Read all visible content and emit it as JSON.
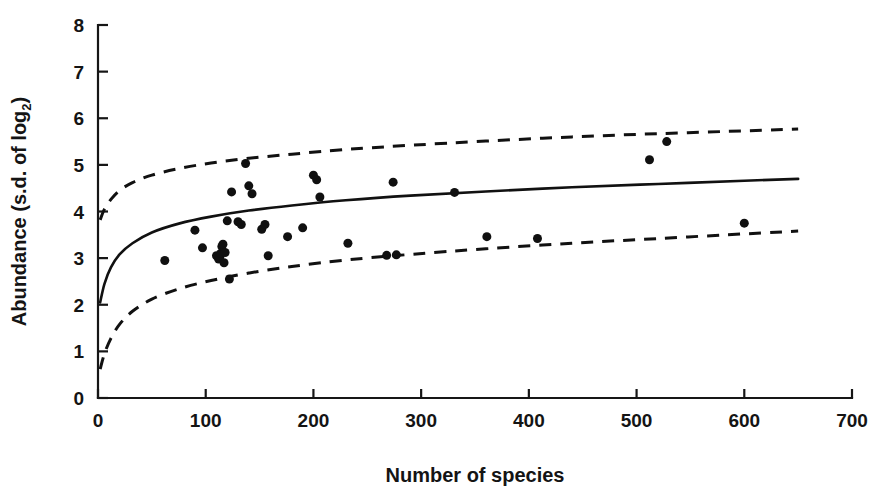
{
  "figure": {
    "background": "#ffffff",
    "ink_color": "#111111"
  },
  "axes": {
    "x": {
      "title": "Number of species",
      "ticks": [
        0,
        100,
        200,
        300,
        400,
        500,
        600,
        700
      ],
      "tick_labels": [
        "0",
        "100",
        "200",
        "300",
        "400",
        "500",
        "600",
        "700"
      ],
      "min": 0,
      "max": 700
    },
    "y": {
      "title_main": "Abundance (s.d. of log",
      "title_sub": "2",
      "title_tail": ")",
      "title_full": "Abundance (s.d. of log2)",
      "ticks": [
        0,
        1,
        2,
        3,
        4,
        5,
        6,
        7,
        8
      ],
      "tick_labels": [
        "0",
        "1",
        "2",
        "3",
        "4",
        "5",
        "6",
        "7",
        "8"
      ],
      "min": 0,
      "max": 8
    }
  },
  "chart_data": {
    "type": "scatter",
    "title": "",
    "xlabel": "Number of species",
    "ylabel": "Abundance (s.d. of log2)",
    "xlim": [
      0,
      700
    ],
    "ylim": [
      0,
      8
    ],
    "grid": false,
    "legend": "none",
    "x": [
      62,
      90,
      97,
      110,
      112,
      113,
      114,
      115,
      116,
      117,
      118,
      120,
      122,
      124,
      130,
      133,
      137,
      140,
      143,
      152,
      155,
      158,
      176,
      190,
      200,
      203,
      206,
      232,
      268,
      274,
      277,
      331,
      361,
      408,
      512,
      528,
      600
    ],
    "y": [
      2.95,
      3.6,
      3.22,
      3.05,
      2.98,
      3.02,
      3.1,
      3.25,
      3.3,
      2.9,
      3.12,
      3.8,
      2.55,
      4.42,
      3.78,
      3.72,
      5.03,
      4.55,
      4.38,
      3.62,
      3.72,
      3.05,
      3.46,
      3.65,
      4.78,
      4.68,
      4.31,
      3.32,
      3.06,
      4.63,
      3.07,
      4.41,
      3.46,
      3.42,
      5.11,
      5.5,
      3.75
    ],
    "points": [
      {
        "x": 62,
        "y": 2.95
      },
      {
        "x": 90,
        "y": 3.6
      },
      {
        "x": 97,
        "y": 3.22
      },
      {
        "x": 110,
        "y": 3.05
      },
      {
        "x": 112,
        "y": 2.98
      },
      {
        "x": 113,
        "y": 3.02
      },
      {
        "x": 114,
        "y": 3.1
      },
      {
        "x": 115,
        "y": 3.25
      },
      {
        "x": 116,
        "y": 3.3
      },
      {
        "x": 117,
        "y": 2.9
      },
      {
        "x": 118,
        "y": 3.12
      },
      {
        "x": 120,
        "y": 3.8
      },
      {
        "x": 122,
        "y": 2.55
      },
      {
        "x": 124,
        "y": 4.42
      },
      {
        "x": 130,
        "y": 3.78
      },
      {
        "x": 133,
        "y": 3.72
      },
      {
        "x": 137,
        "y": 5.03
      },
      {
        "x": 140,
        "y": 4.55
      },
      {
        "x": 143,
        "y": 4.38
      },
      {
        "x": 152,
        "y": 3.62
      },
      {
        "x": 155,
        "y": 3.72
      },
      {
        "x": 158,
        "y": 3.05
      },
      {
        "x": 176,
        "y": 3.46
      },
      {
        "x": 190,
        "y": 3.65
      },
      {
        "x": 200,
        "y": 4.78
      },
      {
        "x": 203,
        "y": 4.68
      },
      {
        "x": 206,
        "y": 4.31
      },
      {
        "x": 232,
        "y": 3.32
      },
      {
        "x": 268,
        "y": 3.06
      },
      {
        "x": 274,
        "y": 4.63
      },
      {
        "x": 277,
        "y": 3.07
      },
      {
        "x": 331,
        "y": 4.41
      },
      {
        "x": 361,
        "y": 3.46
      },
      {
        "x": 408,
        "y": 3.42
      },
      {
        "x": 512,
        "y": 5.11
      },
      {
        "x": 528,
        "y": 5.5
      },
      {
        "x": 600,
        "y": 3.75
      }
    ],
    "marker": {
      "shape": "circle",
      "size_px": 9,
      "color": "#101010"
    },
    "series": [
      {
        "name": "fitted curve",
        "style": "solid",
        "x": [
          2,
          6,
          12,
          20,
          32,
          50,
          75,
          105,
          140,
          180,
          230,
          290,
          360,
          440,
          520,
          600,
          650
        ],
        "y": [
          2.05,
          2.45,
          2.8,
          3.08,
          3.32,
          3.55,
          3.74,
          3.89,
          4.02,
          4.13,
          4.24,
          4.34,
          4.43,
          4.52,
          4.59,
          4.66,
          4.7
        ]
      },
      {
        "name": "upper confidence limit",
        "style": "dashed",
        "x": [
          2,
          6,
          12,
          20,
          32,
          50,
          75,
          105,
          140,
          180,
          230,
          290,
          360,
          440,
          520,
          600,
          650
        ],
        "y": [
          3.82,
          4.05,
          4.26,
          4.45,
          4.62,
          4.78,
          4.92,
          5.04,
          5.14,
          5.23,
          5.33,
          5.42,
          5.51,
          5.6,
          5.67,
          5.73,
          5.77
        ]
      },
      {
        "name": "lower confidence limit",
        "style": "dashed",
        "x": [
          2,
          6,
          12,
          20,
          32,
          50,
          75,
          105,
          140,
          180,
          230,
          290,
          360,
          440,
          520,
          600,
          650
        ],
        "y": [
          0.62,
          0.95,
          1.28,
          1.58,
          1.86,
          2.12,
          2.34,
          2.52,
          2.68,
          2.82,
          2.96,
          3.08,
          3.2,
          3.32,
          3.42,
          3.52,
          3.58
        ]
      }
    ]
  }
}
